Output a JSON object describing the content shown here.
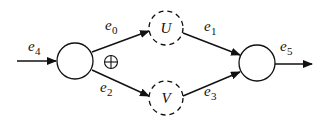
{
  "diagram": {
    "nodes": [
      {
        "id": "source",
        "label": "",
        "style": "solid"
      },
      {
        "id": "U",
        "label": "U",
        "style": "dashed"
      },
      {
        "id": "V",
        "label": "V",
        "style": "dashed"
      },
      {
        "id": "sink",
        "label": "",
        "style": "solid"
      }
    ],
    "edges": [
      {
        "id": "e4",
        "base": "e",
        "sub": "4",
        "from": "input",
        "to": "source"
      },
      {
        "id": "e0",
        "base": "e",
        "sub": "0",
        "from": "source",
        "to": "U"
      },
      {
        "id": "e2",
        "base": "e",
        "sub": "2",
        "from": "source",
        "to": "V"
      },
      {
        "id": "e1",
        "base": "e",
        "sub": "1",
        "from": "U",
        "to": "sink"
      },
      {
        "id": "e3",
        "base": "e",
        "sub": "3",
        "from": "V",
        "to": "sink"
      },
      {
        "id": "e5",
        "base": "e",
        "sub": "5",
        "from": "sink",
        "to": "output"
      }
    ],
    "operator": {
      "symbol": "⊕",
      "name": "xor"
    }
  }
}
